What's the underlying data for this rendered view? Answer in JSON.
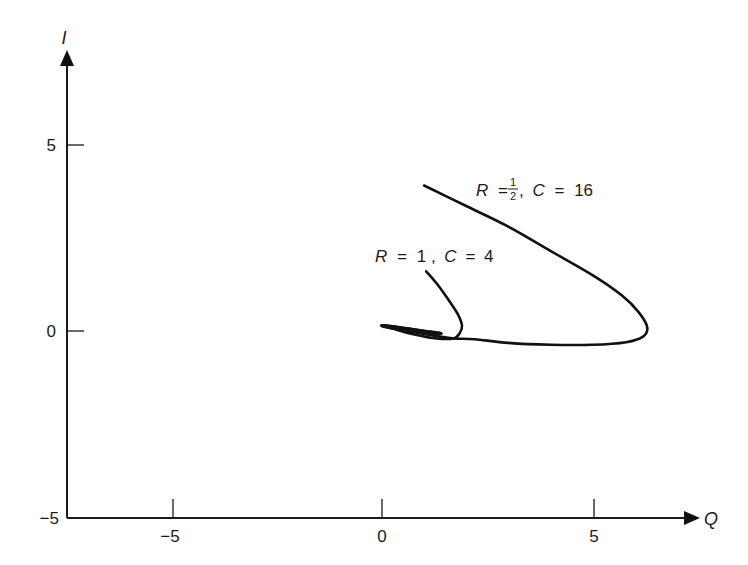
{
  "chart_data": {
    "type": "line",
    "title": "",
    "xlabel": "Q",
    "ylabel": "I",
    "xlim": [
      -7.2,
      7.5
    ],
    "ylim": [
      -5,
      7.5
    ],
    "grid": false,
    "legend": "none (inline annotations)",
    "x_ticks": [
      -5,
      0,
      5
    ],
    "y_ticks": [
      -5,
      0,
      5
    ],
    "x_tick_labels": [
      "−5",
      "0",
      "5"
    ],
    "y_tick_labels": [
      "−5",
      "0",
      "5"
    ],
    "series": [
      {
        "name": "R = 1/2, C = 16",
        "label_parts": {
          "r": "R",
          "eq1": "=",
          "num": "1",
          "den": "2",
          "sep": ",",
          "c": "C",
          "eq2": "=",
          "cval": "16"
        },
        "x": [
          1.0,
          2.0,
          3.0,
          4.0,
          5.0,
          5.7,
          6.1,
          6.3,
          6.2,
          5.8,
          5.0,
          4.0,
          3.0,
          2.2,
          1.7,
          1.2,
          0.6,
          0.1,
          0.0,
          0.4,
          1.0,
          1.4,
          1.2,
          0.8,
          0.5
        ],
        "y": [
          3.9,
          3.35,
          2.8,
          2.15,
          1.5,
          0.95,
          0.5,
          0.1,
          -0.15,
          -0.3,
          -0.37,
          -0.37,
          -0.32,
          -0.22,
          -0.2,
          -0.12,
          0.0,
          0.1,
          0.15,
          0.1,
          0.0,
          -0.07,
          -0.05,
          0.0,
          0.02
        ]
      },
      {
        "name": "R = 1, C = 4",
        "label_parts": {
          "r": "R",
          "eq1": "=",
          "val1": "1",
          "sep": ",",
          "c": "C",
          "eq2": "=",
          "cval": "4"
        },
        "x": [
          1.05,
          1.35,
          1.6,
          1.8,
          1.9,
          1.85,
          1.7,
          1.3,
          0.8,
          0.3,
          0.0,
          0.3,
          0.9,
          1.4,
          1.2,
          0.8,
          0.5
        ],
        "y": [
          1.6,
          1.2,
          0.8,
          0.45,
          0.15,
          -0.05,
          -0.2,
          -0.2,
          -0.1,
          0.05,
          0.15,
          0.12,
          0.02,
          -0.06,
          -0.06,
          -0.01,
          0.02
        ]
      }
    ],
    "annotations": [
      {
        "text": "R = 1/2, C = 16",
        "x": 2.3,
        "y": 3.7
      },
      {
        "text": "R = 1, C = 4",
        "x": -0.4,
        "y": 1.95
      }
    ]
  },
  "axes": {
    "x_label": "Q",
    "y_label": "I",
    "x_tick_minus5": "−5",
    "x_tick_0": "0",
    "x_tick_5": "5",
    "y_tick_minus5": "−5",
    "y_tick_0": "0",
    "y_tick_5": "5"
  },
  "style": {
    "line_color": "#111111",
    "axis_color": "#1a1a1a",
    "background": "#ffffff"
  }
}
